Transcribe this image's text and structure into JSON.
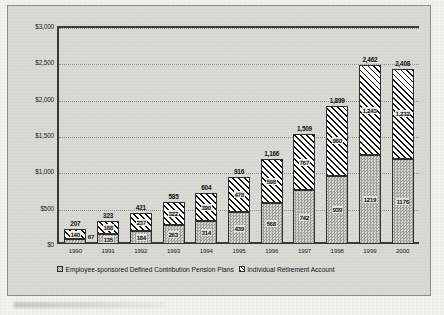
{
  "chart_data": {
    "type": "bar",
    "stacked": true,
    "title": "",
    "xlabel": "",
    "ylabel": "",
    "ylim": [
      0,
      3000
    ],
    "yticks": [
      0,
      500,
      1000,
      1500,
      2000,
      2500,
      3000
    ],
    "ytick_labels": [
      "$0",
      "$500",
      "$1,000",
      "$1,500",
      "$2,000",
      "$2,500",
      "$3,000"
    ],
    "grid": true,
    "legend_position": "bottom",
    "categories": [
      "1990",
      "1991",
      "1992",
      "1993",
      "1994",
      "1995",
      "1996",
      "1997",
      "1998",
      "1999",
      "2000"
    ],
    "series": [
      {
        "name": "Employee-sponsored Defined Contribution Pension Plans",
        "fill": "checker",
        "values": [
          67,
          135,
          184,
          263,
          314,
          439,
          568,
          742,
          939,
          1219,
          1176
        ],
        "labels": [
          "67",
          "135",
          "184",
          "263",
          "314",
          "439",
          "568",
          "742",
          "939",
          "1219",
          "1176"
        ]
      },
      {
        "name": "Individual Retirement Account",
        "fill": "diagonal-hatch",
        "values": [
          140,
          188,
          237,
          322,
          390,
          478,
          598,
          767,
          960,
          1243,
          1232
        ],
        "labels": [
          "140",
          "188",
          "237",
          "322",
          "390",
          "478",
          "598",
          "767",
          "960",
          "1,243",
          "1,232"
        ]
      }
    ],
    "totals": [
      207,
      323,
      421,
      585,
      604,
      916,
      1166,
      1509,
      1899,
      2462,
      2408
    ],
    "total_labels": [
      "207",
      "323",
      "421",
      "585",
      "604",
      "916",
      "1,166",
      "1,509",
      "1,899",
      "2,462",
      "2,408"
    ]
  },
  "colors": {
    "frame_background": "#d9d9d6",
    "page_background": "#f2f2f0",
    "axis": "#3a3a38",
    "gridline": "#8e8e8b",
    "text": "#141414",
    "dc_fill": "#b6b6b3",
    "ira_fill": "#111111"
  }
}
